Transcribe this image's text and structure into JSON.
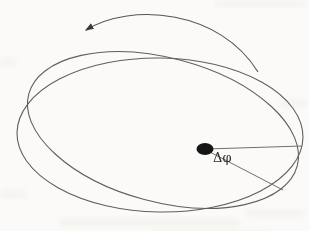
{
  "figure": {
    "angle_label": "Δφ",
    "central_mass": "filled-black-dot",
    "colors": {
      "background": "#fbfaf8",
      "orbit_stroke": "#5f5f5f",
      "radius_stroke": "#6e6e6e",
      "arrow_stroke": "#555555",
      "mass_fill": "#151515",
      "label_color": "#2e2e2e",
      "noise": "#9a978c"
    }
  }
}
